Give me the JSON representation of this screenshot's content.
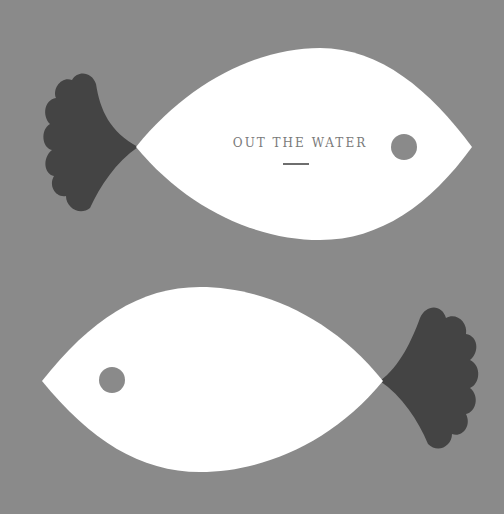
{
  "title": "OUT THE WATER",
  "colors": {
    "background": "#8a8a8a",
    "body": "#ffffff",
    "fin": "#444444",
    "eye": "#8a8a8a"
  },
  "fish": [
    {
      "name": "top-fish",
      "direction": "right"
    },
    {
      "name": "bottom-fish",
      "direction": "left"
    }
  ]
}
